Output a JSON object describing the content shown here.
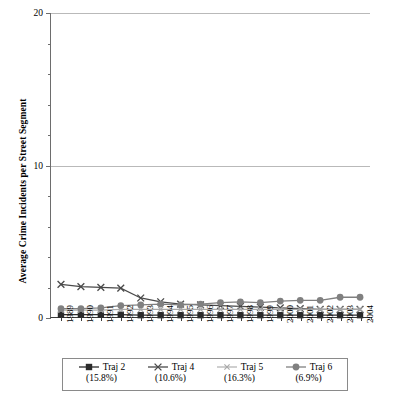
{
  "chart_data": {
    "type": "line",
    "title": "",
    "xlabel": "",
    "ylabel": "Average Crime Incidents per Street Segment",
    "ylim": [
      0,
      20
    ],
    "yticks": [
      0,
      10,
      20
    ],
    "ytick_labels": [
      "0",
      "10",
      "20"
    ],
    "grid": true,
    "legend_position": "bottom",
    "categories": [
      "1989",
      "1990",
      "1991",
      "1992",
      "1993",
      "1994",
      "1995",
      "1996",
      "1997",
      "1998",
      "1999",
      "2000",
      "2001",
      "2002",
      "2003",
      "2004"
    ],
    "series": [
      {
        "name": "Traj 2",
        "percent": "(15.8%)",
        "marker": "filled-square",
        "color": "#2b2b2b",
        "values": [
          0.15,
          0.15,
          0.15,
          0.15,
          0.12,
          0.12,
          0.12,
          0.12,
          0.12,
          0.12,
          0.12,
          0.12,
          0.12,
          0.12,
          0.12,
          0.12
        ]
      },
      {
        "name": "Traj 4",
        "percent": "(10.6%)",
        "marker": "cross-x",
        "color": "#4a4a4a",
        "values": [
          2.15,
          2.0,
          1.95,
          1.9,
          1.25,
          1.0,
          0.85,
          0.8,
          0.75,
          0.7,
          0.65,
          0.6,
          0.55,
          0.5,
          0.5,
          0.5
        ]
      },
      {
        "name": "Traj 5",
        "percent": "(16.3%)",
        "marker": "small-x",
        "color": "#a8a8a8",
        "values": [
          0.45,
          0.45,
          0.45,
          0.5,
          0.5,
          0.5,
          0.5,
          0.5,
          0.5,
          0.5,
          0.5,
          0.5,
          0.5,
          0.5,
          0.5,
          0.5
        ]
      },
      {
        "name": "Traj 6",
        "percent": "(6.9%)",
        "marker": "filled-circle",
        "color": "#808080",
        "values": [
          0.55,
          0.55,
          0.6,
          0.75,
          0.8,
          0.85,
          0.8,
          0.85,
          0.95,
          1.0,
          0.95,
          1.05,
          1.1,
          1.1,
          1.3,
          1.3
        ]
      }
    ]
  }
}
